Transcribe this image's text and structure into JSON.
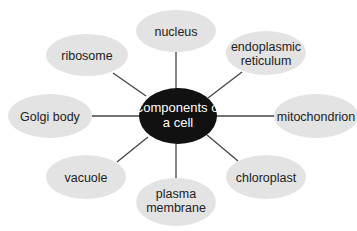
{
  "diagram": {
    "type": "spider-diagram",
    "colors": {
      "background": "#ffffff",
      "center_fill": "#111111",
      "center_text": "#ffffff",
      "node_fill": "#e3e3e3",
      "node_text": "#222222",
      "connector": "#444444"
    },
    "center": {
      "lines": [
        "Components of",
        "a cell"
      ]
    },
    "nodes": [
      {
        "id": "nucleus",
        "lines": [
          "nucleus"
        ]
      },
      {
        "id": "endoplasmic-reticulum",
        "lines": [
          "endoplasmic",
          "reticulum"
        ]
      },
      {
        "id": "mitochondrion",
        "lines": [
          "mitochondrion"
        ]
      },
      {
        "id": "chloroplast",
        "lines": [
          "chloroplast"
        ]
      },
      {
        "id": "plasma-membrane",
        "lines": [
          "plasma",
          "membrane"
        ]
      },
      {
        "id": "vacuole",
        "lines": [
          "vacuole"
        ]
      },
      {
        "id": "golgi-body",
        "lines": [
          "Golgi body"
        ]
      },
      {
        "id": "ribosome",
        "lines": [
          "ribosome"
        ]
      }
    ]
  }
}
